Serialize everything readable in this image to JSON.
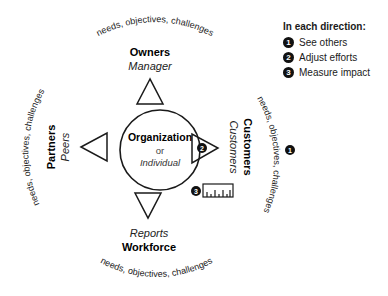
{
  "center": {
    "title": "Organization",
    "connector": "or",
    "subtitle": "Individual"
  },
  "directions": {
    "top": {
      "group": "Owners",
      "role": "Manager",
      "arc_text": "needs, objectives, challenges"
    },
    "right": {
      "group": "Customers",
      "role": "Customers",
      "arc_text": "needs, objectives, challenges"
    },
    "bottom": {
      "group": "Workforce",
      "role": "Reports",
      "arc_text": "needs, objectives, challenges"
    },
    "left": {
      "group": "Partners",
      "role": "Peers",
      "arc_text": "needs, objectives, challenges"
    }
  },
  "markers": {
    "see_others": "1",
    "adjust_efforts": "2",
    "measure_impact": "3"
  },
  "legend": {
    "title": "In each direction:",
    "items": [
      {
        "number": "1",
        "label": "See others"
      },
      {
        "number": "2",
        "label": "Adjust efforts"
      },
      {
        "number": "3",
        "label": "Measure impact"
      }
    ]
  },
  "colors": {
    "stroke": "#1a1a1a",
    "badge": "#111111",
    "background": "#ffffff"
  }
}
